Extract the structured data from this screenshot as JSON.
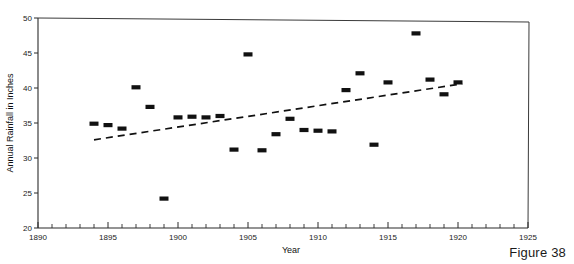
{
  "figure": {
    "caption": "Figure 38"
  },
  "chart_data": {
    "type": "scatter",
    "title": "",
    "xlabel": "Year",
    "ylabel": "Annual Rainfall in Inches",
    "xlim": [
      1890,
      1925
    ],
    "ylim": [
      20,
      50
    ],
    "xticks": [
      1890,
      1895,
      1900,
      1905,
      1910,
      1915,
      1920,
      1925
    ],
    "xticklabels": [
      "1890",
      "1895",
      "1900",
      "1905",
      "1910",
      "1915",
      "1920",
      "1925"
    ],
    "x_minor_tick_step": 1,
    "yticks": [
      20,
      25,
      30,
      35,
      40,
      45,
      50
    ],
    "yticklabels": [
      "20",
      "25",
      "30",
      "35",
      "40",
      "45",
      "50"
    ],
    "grid": false,
    "legend": null,
    "marker_style": "filled rectangle",
    "x": [
      1894,
      1895,
      1896,
      1897,
      1898,
      1899,
      1900,
      1901,
      1902,
      1903,
      1904,
      1905,
      1906,
      1907,
      1908,
      1909,
      1910,
      1911,
      1912,
      1913,
      1914,
      1915,
      1917,
      1918,
      1919,
      1920
    ],
    "y": [
      34.9,
      34.7,
      34.2,
      40.1,
      37.3,
      24.2,
      35.8,
      35.9,
      35.8,
      36.0,
      31.2,
      44.8,
      31.1,
      33.4,
      35.6,
      34.0,
      33.9,
      33.8,
      39.7,
      42.1,
      31.9,
      40.8,
      47.8,
      41.2,
      39.1,
      40.8
    ],
    "series": [
      {
        "name": "Annual rainfall",
        "points": [
          {
            "x": 1894,
            "y": 34.9
          },
          {
            "x": 1895,
            "y": 34.7
          },
          {
            "x": 1896,
            "y": 34.2
          },
          {
            "x": 1897,
            "y": 40.1
          },
          {
            "x": 1898,
            "y": 37.3
          },
          {
            "x": 1899,
            "y": 24.2
          },
          {
            "x": 1900,
            "y": 35.8
          },
          {
            "x": 1901,
            "y": 35.9
          },
          {
            "x": 1902,
            "y": 35.8
          },
          {
            "x": 1903,
            "y": 36.0
          },
          {
            "x": 1904,
            "y": 31.2
          },
          {
            "x": 1905,
            "y": 44.8
          },
          {
            "x": 1906,
            "y": 31.1
          },
          {
            "x": 1907,
            "y": 33.4
          },
          {
            "x": 1908,
            "y": 35.6
          },
          {
            "x": 1909,
            "y": 34.0
          },
          {
            "x": 1910,
            "y": 33.9
          },
          {
            "x": 1911,
            "y": 33.8
          },
          {
            "x": 1912,
            "y": 39.7
          },
          {
            "x": 1913,
            "y": 42.1
          },
          {
            "x": 1914,
            "y": 31.9
          },
          {
            "x": 1915,
            "y": 40.8
          },
          {
            "x": 1917,
            "y": 47.8
          },
          {
            "x": 1918,
            "y": 41.2
          },
          {
            "x": 1919,
            "y": 39.1
          },
          {
            "x": 1920,
            "y": 40.8
          }
        ]
      }
    ],
    "trend_line": {
      "name": "trend",
      "style": "dashed",
      "x_start": 1894,
      "y_start": 32.6,
      "x_end": 1920.3,
      "y_end": 40.6
    },
    "colors": {
      "marker": "#111111",
      "trend": "#111111",
      "axis": "#2b2b2b",
      "background": "#ffffff"
    }
  }
}
